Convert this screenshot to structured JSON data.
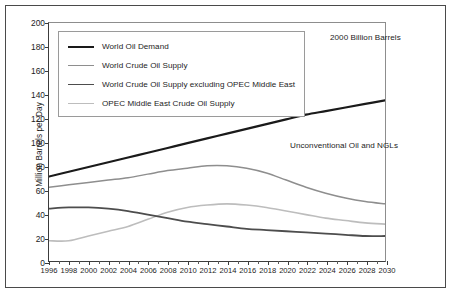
{
  "chart": {
    "title_annotation": "2000 Billion Barrels",
    "inline_annotation": "Unconventional Oil and NGLs",
    "ylabel": "Million Barrels per Day"
  },
  "chart_data": {
    "type": "line",
    "title": "2000 Billion Barrels",
    "xlabel": "",
    "ylabel": "Million Barrels per Day",
    "xlim": [
      1996,
      2030
    ],
    "ylim": [
      0,
      200
    ],
    "yticks": [
      0,
      20,
      40,
      60,
      80,
      100,
      120,
      140,
      160,
      180,
      200
    ],
    "xticks": [
      1996,
      1998,
      2000,
      2002,
      2004,
      2006,
      2008,
      2010,
      2012,
      2014,
      2016,
      2018,
      2020,
      2022,
      2024,
      2026,
      2028,
      2030
    ],
    "minor_xticks_every": 1,
    "grid": false,
    "legend_position": "upper-left",
    "annotations": [
      {
        "text": "2000 Billion Barrels",
        "x": 2026,
        "y": 187
      },
      {
        "text": "Unconventional Oil and NGLs",
        "x": 2021,
        "y": 103
      }
    ],
    "x": [
      1996,
      1998,
      2000,
      2002,
      2004,
      2006,
      2008,
      2010,
      2012,
      2014,
      2016,
      2018,
      2020,
      2022,
      2024,
      2026,
      2028,
      2030
    ],
    "series": [
      {
        "name": "World Oil Demand",
        "color": "#1a1a1a",
        "width": 2.2,
        "values": [
          71,
          75,
          79,
          83,
          87,
          91,
          95,
          99,
          103,
          107,
          111,
          115,
          119,
          123,
          126,
          129,
          132,
          135
        ]
      },
      {
        "name": "World Crude Oil Supply",
        "color": "#8e8e8e",
        "width": 1.5,
        "values": [
          62,
          64,
          66,
          68,
          70,
          73,
          76,
          78,
          80,
          80,
          78,
          74,
          68,
          62,
          57,
          53,
          50,
          48
        ]
      },
      {
        "name": "World Crude Oil Supply excluding OPEC Middle East",
        "color": "#4d4d4d",
        "width": 1.8,
        "values": [
          44,
          45,
          45,
          44,
          42,
          39,
          36,
          33,
          31,
          29,
          27,
          26,
          25,
          24,
          23,
          22,
          21,
          21
        ]
      },
      {
        "name": "OPEC Middle East Crude Oil Supply",
        "color": "#bdbdbd",
        "width": 1.6,
        "values": [
          17,
          17,
          21,
          25,
          29,
          35,
          41,
          45,
          47,
          48,
          47,
          45,
          42,
          39,
          36,
          34,
          32,
          31
        ]
      }
    ]
  },
  "legend": {
    "items": [
      {
        "label": "World Oil Demand"
      },
      {
        "label": "World Crude Oil Supply"
      },
      {
        "label": "World Crude Oil Supply excluding OPEC Middle East"
      },
      {
        "label": "OPEC Middle East Crude Oil Supply"
      }
    ]
  }
}
